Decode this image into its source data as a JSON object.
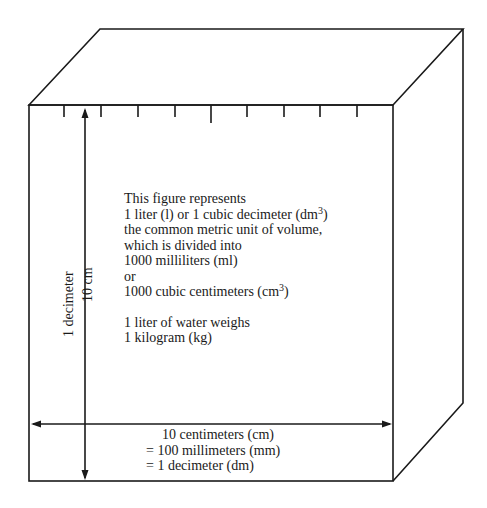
{
  "figure": {
    "description_lines": [
      "This figure represents",
      "1 liter (l) or 1 cubic decimeter (dm",
      "the common metric unit of volume,",
      "which is divided into",
      "1000 milliliters (ml)",
      "or",
      "1000 cubic centimeters (cm"
    ],
    "superscript_3": "3",
    "line2_close": ")",
    "line7_close": ")",
    "weight_lines": [
      "1 liter of water weighs",
      "1 kilogram (kg)"
    ],
    "vertical_labels": {
      "outer": "1 decimeter",
      "inner": "10 cm"
    },
    "horizontal_labels": [
      "10 centimeters (cm)",
      "= 100 millimeters (mm)",
      "= 1 decimeter (dm)"
    ],
    "tick_count": 9,
    "line_color": "#1a1a1a"
  }
}
